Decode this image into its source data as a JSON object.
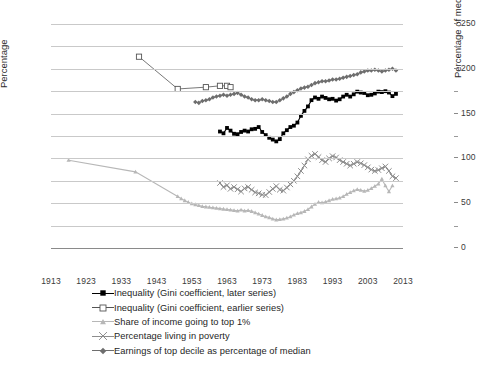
{
  "chart_data": {
    "type": "line",
    "title": "",
    "xlabel": "",
    "ylabel": "Percentage",
    "ylabel_right": "Percentage of median",
    "xlim": [
      1913,
      2013
    ],
    "ylim": [
      0,
      50
    ],
    "ylim_right": [
      0,
      250
    ],
    "xticks": [
      1913,
      1923,
      1933,
      1943,
      1953,
      1963,
      1973,
      1983,
      1993,
      2003,
      2013
    ],
    "yticks": [
      0,
      5,
      10,
      15,
      20,
      25,
      30,
      35,
      40,
      45,
      50
    ],
    "yticks_right": [
      0,
      50,
      100,
      150,
      200,
      250
    ],
    "grid": true,
    "legend_position": "below",
    "colors": {
      "gini_later": "#000000",
      "gini_earlier": "#555555",
      "top1_share": "#b7b7b7",
      "poverty": "#8d8d8d",
      "top_decile": "#6e6e6e",
      "gridline": "#c9c9c9",
      "axis": "#8a8a8a",
      "text": "#2b2b2b"
    },
    "series": [
      {
        "name": "Inequality (Gini coefficient, later series)",
        "axis": "left",
        "marker": "filled-square",
        "color": "#000000",
        "x": [
          1961,
          1962,
          1963,
          1964,
          1965,
          1966,
          1967,
          1968,
          1969,
          1970,
          1971,
          1972,
          1973,
          1974,
          1975,
          1976,
          1977,
          1978,
          1979,
          1980,
          1981,
          1982,
          1983,
          1984,
          1985,
          1986,
          1987,
          1988,
          1989,
          1990,
          1991,
          1992,
          1993,
          1994,
          1995,
          1996,
          1997,
          1998,
          1999,
          2000,
          2001,
          2002,
          2003,
          2004,
          2005,
          2006,
          2007,
          2008,
          2009,
          2010,
          2011
        ],
        "y": [
          26.0,
          25.6,
          26.8,
          26.2,
          25.5,
          25.4,
          25.9,
          26.2,
          26.0,
          26.5,
          26.6,
          27.0,
          25.9,
          25.2,
          24.6,
          24.2,
          23.8,
          24.3,
          25.6,
          26.3,
          27.0,
          27.3,
          28.0,
          29.5,
          30.6,
          31.6,
          33.0,
          33.6,
          33.3,
          33.8,
          33.5,
          33.2,
          33.3,
          32.9,
          33.2,
          33.8,
          34.2,
          33.8,
          34.3,
          34.9,
          34.7,
          34.6,
          34.1,
          34.2,
          34.5,
          34.9,
          34.8,
          35.0,
          34.7,
          33.9,
          34.4
        ]
      },
      {
        "name": "Inequality (Gini coefficient, earlier series)",
        "axis": "left",
        "marker": "open-square",
        "color": "#555555",
        "x": [
          1938,
          1949,
          1957,
          1961,
          1963,
          1964
        ],
        "y": [
          42.7,
          35.5,
          35.9,
          36.2,
          36.2,
          35.9
        ]
      },
      {
        "name": "Share of income going to top 1%",
        "axis": "left",
        "marker": "filled-triangle",
        "color": "#b7b7b7",
        "x": [
          1918,
          1937,
          1949,
          1950,
          1951,
          1952,
          1953,
          1954,
          1955,
          1956,
          1957,
          1958,
          1959,
          1960,
          1961,
          1962,
          1963,
          1964,
          1965,
          1966,
          1967,
          1968,
          1969,
          1970,
          1971,
          1972,
          1973,
          1974,
          1975,
          1976,
          1977,
          1978,
          1979,
          1980,
          1981,
          1982,
          1983,
          1984,
          1985,
          1986,
          1987,
          1988,
          1989,
          1990,
          1991,
          1992,
          1993,
          1994,
          1995,
          1996,
          1997,
          1998,
          1999,
          2000,
          2001,
          2002,
          2003,
          2004,
          2005,
          2006,
          2007,
          2008,
          2009,
          2010
        ],
        "y": [
          19.6,
          17.0,
          11.5,
          11.0,
          10.6,
          10.2,
          9.9,
          9.7,
          9.5,
          9.3,
          9.2,
          9.1,
          9.0,
          8.9,
          8.8,
          8.7,
          8.6,
          8.5,
          8.4,
          8.3,
          8.5,
          8.3,
          8.4,
          8.2,
          7.9,
          7.6,
          7.3,
          7.0,
          6.8,
          6.5,
          6.3,
          6.4,
          6.5,
          6.7,
          7.0,
          7.4,
          7.7,
          7.9,
          8.2,
          8.6,
          9.2,
          9.8,
          10.2,
          10.1,
          10.3,
          10.6,
          10.9,
          11.0,
          11.2,
          11.5,
          12.0,
          12.4,
          12.8,
          13.1,
          12.9,
          12.7,
          12.9,
          13.3,
          13.8,
          14.3,
          15.4,
          13.9,
          12.6,
          13.9
        ]
      },
      {
        "name": "Percentage living in poverty",
        "axis": "left",
        "marker": "x-cross",
        "color": "#8d8d8d",
        "x": [
          1961,
          1962,
          1963,
          1964,
          1965,
          1966,
          1967,
          1968,
          1969,
          1970,
          1971,
          1972,
          1973,
          1974,
          1975,
          1976,
          1977,
          1978,
          1979,
          1980,
          1981,
          1982,
          1983,
          1984,
          1985,
          1986,
          1987,
          1988,
          1989,
          1990,
          1991,
          1992,
          1993,
          1994,
          1995,
          1996,
          1997,
          1998,
          1999,
          2000,
          2001,
          2002,
          2003,
          2004,
          2005,
          2006,
          2007,
          2008,
          2009,
          2010,
          2011
        ],
        "y": [
          14.5,
          13.6,
          14.0,
          13.2,
          13.6,
          13.1,
          12.6,
          13.3,
          13.6,
          13.0,
          12.4,
          12.2,
          11.9,
          11.8,
          12.5,
          13.2,
          13.8,
          13.0,
          12.8,
          13.5,
          14.2,
          15.0,
          16.0,
          17.2,
          18.4,
          19.8,
          20.6,
          21.0,
          20.3,
          19.6,
          19.2,
          20.0,
          20.5,
          20.2,
          19.6,
          19.2,
          18.8,
          18.4,
          18.8,
          19.2,
          18.9,
          18.5,
          18.0,
          17.5,
          17.2,
          17.4,
          17.8,
          18.2,
          17.2,
          16.0,
          15.6
        ]
      },
      {
        "name": "Earnings of top decile as percentage of median",
        "axis": "right",
        "marker": "filled-diamond",
        "color": "#6e6e6e",
        "x": [
          1954,
          1955,
          1956,
          1957,
          1958,
          1959,
          1960,
          1961,
          1962,
          1963,
          1964,
          1965,
          1966,
          1967,
          1968,
          1969,
          1970,
          1971,
          1972,
          1973,
          1974,
          1975,
          1976,
          1977,
          1978,
          1979,
          1980,
          1981,
          1982,
          1983,
          1984,
          1985,
          1986,
          1987,
          1988,
          1989,
          1990,
          1991,
          1992,
          1993,
          1994,
          1995,
          1996,
          1997,
          1998,
          1999,
          2000,
          2001,
          2002,
          2003,
          2004,
          2005,
          2006,
          2007,
          2008,
          2009,
          2010,
          2011
        ],
        "y": [
          163,
          162,
          164,
          165,
          166,
          168,
          169,
          170,
          171,
          170,
          171,
          172,
          173,
          171,
          169,
          168,
          166,
          165,
          165,
          166,
          165,
          164,
          163,
          163,
          165,
          167,
          169,
          172,
          174,
          176,
          178,
          179,
          180,
          182,
          184,
          185,
          186,
          186,
          187,
          188,
          188,
          189,
          190,
          191,
          192,
          193,
          194,
          196,
          197,
          198,
          198,
          199,
          198,
          197,
          198,
          199,
          200,
          198
        ]
      }
    ]
  },
  "axes": {
    "left": {
      "title": "Percentage",
      "ticks": [
        "0",
        "5",
        "10",
        "15",
        "20",
        "25",
        "30",
        "35",
        "40",
        "45",
        "50"
      ]
    },
    "right": {
      "title": "Percentage of median",
      "ticks": [
        "0",
        "50",
        "100",
        "150",
        "200",
        "250"
      ]
    },
    "bottom": {
      "ticks": [
        "1913",
        "1923",
        "1933",
        "1943",
        "1953",
        "1963",
        "1973",
        "1983",
        "1993",
        "2003",
        "2013"
      ]
    }
  },
  "legend": {
    "items": [
      {
        "label": "Inequality (Gini coefficient, later series)",
        "marker": "filled-square",
        "color": "#000000"
      },
      {
        "label": "Inequality (Gini coefficient, earlier series)",
        "marker": "open-square",
        "color": "#555555"
      },
      {
        "label": "Share of income going to top 1%",
        "marker": "filled-triangle",
        "color": "#b7b7b7"
      },
      {
        "label": "Percentage living in poverty",
        "marker": "x-cross",
        "color": "#8d8d8d"
      },
      {
        "label": "Earnings of top decile as percentage of median",
        "marker": "filled-diamond",
        "color": "#6e6e6e"
      }
    ]
  }
}
